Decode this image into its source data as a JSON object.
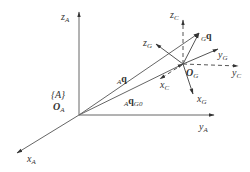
{
  "diagram": {
    "title": "",
    "frames": {
      "A": {
        "label": "{A}",
        "origin_label": "O",
        "origin_sub": "A",
        "axes": {
          "x": {
            "label": "x",
            "sub": "A"
          },
          "y": {
            "label": "y",
            "sub": "A"
          },
          "z": {
            "label": "z",
            "sub": "A"
          }
        }
      },
      "G": {
        "origin_label": "O",
        "origin_sub": "G",
        "axes": {
          "x": {
            "label": "x",
            "sub": "G"
          },
          "y": {
            "label": "y",
            "sub": "G"
          },
          "z": {
            "label": "z",
            "sub": "G"
          }
        }
      },
      "C": {
        "axes": {
          "x": {
            "label": "x",
            "sub": "C",
            "style": "dashed"
          },
          "y": {
            "label": "y",
            "sub": "C",
            "style": "dashed"
          },
          "z": {
            "label": "z",
            "sub": "C",
            "style": "dashed"
          }
        }
      }
    },
    "vectors": {
      "Aq": {
        "pre": "A",
        "label": "q"
      },
      "AqG0": {
        "pre": "A",
        "label": "q",
        "sub": "G0"
      },
      "Gq": {
        "pre": "G",
        "label": "q"
      }
    },
    "colors": {
      "line": "#555555",
      "text": "#333333"
    }
  }
}
